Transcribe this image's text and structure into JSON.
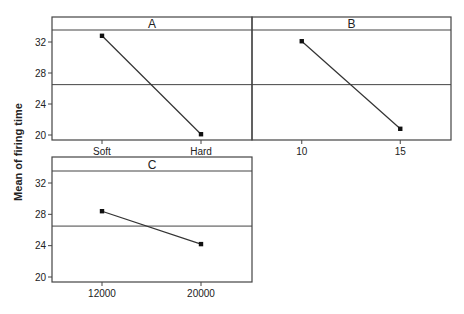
{
  "chart_data": {
    "type": "line",
    "title": "",
    "ylabel": "Mean of firing time",
    "ylim": [
      19.3,
      33.6
    ],
    "yticks": [
      20,
      24,
      28,
      32
    ],
    "grand_mean": 26.5,
    "grid": false,
    "legend": null,
    "panels": [
      {
        "name": "A",
        "categories": [
          "Soft",
          "Hard"
        ],
        "values": [
          32.8,
          20.1
        ]
      },
      {
        "name": "B",
        "categories": [
          "10",
          "15"
        ],
        "values": [
          32.1,
          20.8
        ]
      },
      {
        "name": "C",
        "categories": [
          "12000",
          "20000"
        ],
        "values": [
          28.4,
          24.2
        ]
      }
    ]
  },
  "colors": {
    "frame": "#444444",
    "line": "#333333",
    "point": "#111111",
    "text": "#222222"
  }
}
